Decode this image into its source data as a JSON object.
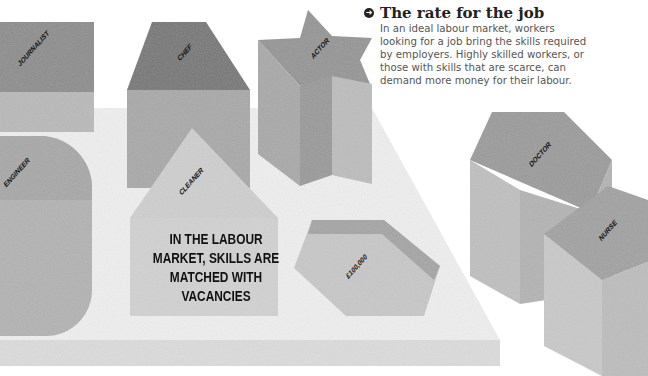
{
  "caption": {
    "bullet_icon": "arrow-circle-icon",
    "title": "The rate for the job",
    "body": "In an ideal labour market, workers looking for a job bring the skills required by employers. Highly skilled workers, or those with skills that are scarce, can demand more money for their labour."
  },
  "illustration": {
    "main_message": "IN THE LABOUR MARKET, SKILLS ARE MATCHED WITH VACANCIES",
    "blocks": [
      {
        "shape": "square",
        "label": "JOURNALIST"
      },
      {
        "shape": "trapezoid",
        "label": "CHEF"
      },
      {
        "shape": "star",
        "label": "ACTOR"
      },
      {
        "shape": "half-round",
        "label": "ENGINEER"
      },
      {
        "shape": "house",
        "label": "CLEANER"
      },
      {
        "shape": "hexagon-slot",
        "label": "£100,000"
      },
      {
        "shape": "pentagon",
        "label": "DOCTOR"
      },
      {
        "shape": "cube",
        "label": "NURSE"
      }
    ]
  },
  "colors": {
    "board_top": "#eeeeee",
    "board_edge": "#dcdcdc",
    "block_top_dark": "#8a8a8a",
    "block_side": "#b5b5b5",
    "block_light": "#cfcfcf",
    "text": "#111111"
  }
}
